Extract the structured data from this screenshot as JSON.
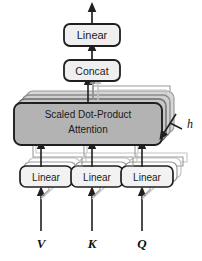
{
  "figure": {
    "name": "multi-head-attention",
    "background": "#ffffff",
    "width": 202,
    "height": 261
  },
  "blocks": {
    "top_linear": {
      "label": "Linear",
      "fill": "#ededed",
      "stroke": "#1f1f1f"
    },
    "concat": {
      "label": "Concat",
      "fill": "#ededed",
      "stroke": "#1f1f1f"
    },
    "attention": {
      "label_line1": "Scaled Dot-Product",
      "label_line2": "Attention",
      "fill": "#b3b3b3",
      "stroke": "#1f1f1f"
    },
    "linear_v": {
      "label": "Linear",
      "fill": "#f2f2f2",
      "stroke": "#1f1f1f"
    },
    "linear_k": {
      "label": "Linear",
      "fill": "#f2f2f2",
      "stroke": "#1f1f1f"
    },
    "linear_q": {
      "label": "Linear",
      "fill": "#f2f2f2",
      "stroke": "#1f1f1f"
    }
  },
  "inputs": {
    "v": "V",
    "k": "K",
    "q": "Q"
  },
  "annotations": {
    "heads": "h"
  },
  "colors": {
    "stroke_dark": "#1f1f1f",
    "stroke_mid": "#9a9a9a",
    "stroke_light": "#c4c4c4",
    "attention_fill": "#b3b3b3",
    "attention_fill_back": "#cfcfcf",
    "box_fill": "#efefef",
    "text": "#1a1a1a"
  }
}
